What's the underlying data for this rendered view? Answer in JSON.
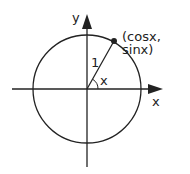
{
  "diagram": {
    "type": "unit-circle",
    "axis_labels": {
      "x": "x",
      "y": "y"
    },
    "radius_label": "1",
    "angle_label": "x",
    "point_label": "(cosx, sinx)",
    "colors": {
      "stroke": "#222222",
      "background": "#ffffff"
    }
  }
}
